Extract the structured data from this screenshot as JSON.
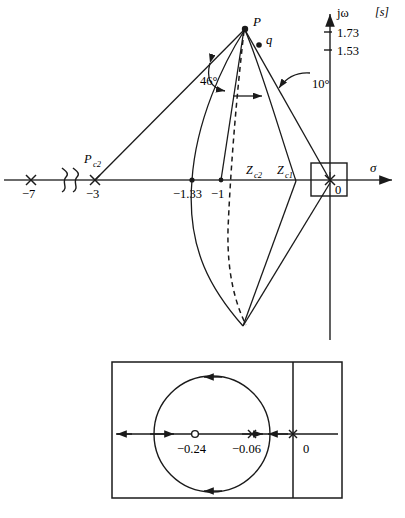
{
  "figure": {
    "type": "root-locus-diagram",
    "plane_label": "[s]",
    "real_axis_label": "σ",
    "imag_axis_label": "jω"
  },
  "main_plot": {
    "imag_ticks": [
      {
        "label": "1.73",
        "value": 1.73
      },
      {
        "label": "1.53",
        "value": 1.53
      }
    ],
    "real_axis_marks": [
      {
        "label": "−7",
        "value": -7,
        "marker": "cross"
      },
      {
        "label": "−3",
        "value": -3,
        "marker": "cross"
      },
      {
        "label": "−1.33",
        "value": -1.33,
        "marker": "dot"
      },
      {
        "label": "−1",
        "value": -1,
        "marker": "dot"
      },
      {
        "label": "0",
        "value": 0,
        "marker": "cross"
      }
    ],
    "axis_break_symbol": "∿∿",
    "points": [
      {
        "name": "P",
        "label": "P"
      },
      {
        "name": "q",
        "label": "q"
      }
    ],
    "compensator_labels": [
      {
        "name": "pole-pc2",
        "label": "P",
        "sub": "c2"
      },
      {
        "name": "zero-zc2",
        "label": "Z",
        "sub": "c2"
      },
      {
        "name": "zero-zc1",
        "label": "Z",
        "sub": "c1"
      }
    ],
    "angles": [
      {
        "name": "angle-46",
        "label": "46°",
        "value": 46
      },
      {
        "name": "angle-10",
        "label": "10°",
        "value": 10
      }
    ],
    "origin_zoom_box": "highlight-rectangle-at-origin"
  },
  "inset_plot": {
    "title": "origin-detail",
    "marks": [
      {
        "label": "−0.24",
        "value": -0.24,
        "marker": "open-circle",
        "kind": "zero"
      },
      {
        "label": "−0.06",
        "value": -0.06,
        "marker": "cross",
        "kind": "pole"
      },
      {
        "label": "0",
        "value": 0,
        "marker": "cross",
        "kind": "pole"
      }
    ],
    "locus_shape": "circle",
    "direction_arrows": [
      "left-top",
      "left-bottom",
      "right-on-axis",
      "left-on-axis"
    ]
  },
  "colors": {
    "line": "#1a1a1a",
    "axis": "#3a3a3a",
    "background": "#ffffff"
  }
}
